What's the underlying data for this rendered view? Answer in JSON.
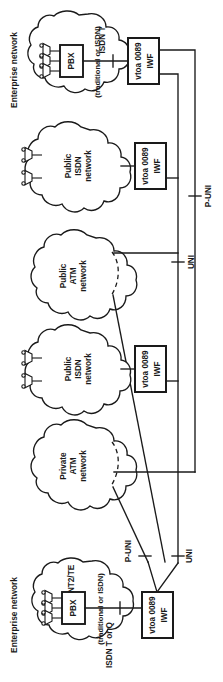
{
  "figure": {
    "orientation": "rotated-90-ccw",
    "colors": {
      "ink": "#1a1a1a",
      "paper": "#ffffff"
    }
  },
  "groups": {
    "enterprise_top": {
      "label": "Enterprise network"
    },
    "enterprise_bottom": {
      "label": "Enterprise network"
    }
  },
  "clouds": [
    {
      "id": "enterprise-top",
      "name": "enterprise-cloud-top",
      "inner_label": "(traditional or ISDN)",
      "device": {
        "label": "PBX",
        "suffix": ""
      },
      "phones": 3,
      "dashed_edge": false
    },
    {
      "id": "public-isdn-upper",
      "name": "public-isdn-cloud-upper",
      "lines": [
        "Public",
        "ISDN",
        "network"
      ],
      "phones": 2,
      "dashed_edge": false
    },
    {
      "id": "public-atm",
      "name": "public-atm-cloud",
      "lines": [
        "Public",
        "ATM",
        "network"
      ],
      "phones": 0,
      "dashed_edge": true
    },
    {
      "id": "public-isdn-lower",
      "name": "public-isdn-cloud-lower",
      "lines": [
        "Public",
        "ISDN",
        "network"
      ],
      "phones": 2,
      "dashed_edge": false
    },
    {
      "id": "private-atm",
      "name": "private-atm-cloud",
      "lines": [
        "Private",
        "ATM",
        "network"
      ],
      "phones": 0,
      "dashed_edge": true
    },
    {
      "id": "enterprise-bottom",
      "name": "enterprise-cloud-bottom",
      "inner_label": "(traditional or ISDN)",
      "device": {
        "label": "PBX",
        "suffix": "NT2/TE"
      },
      "phones": 3,
      "dashed_edge": false
    }
  ],
  "iwf_boxes": [
    {
      "id": "iwf-1",
      "name": "iwf-box-top",
      "line1": "vtoa 0089",
      "line2": "IWF"
    },
    {
      "id": "iwf-2",
      "name": "iwf-box-isdn-upper",
      "line1": "vtoa 0089",
      "line2": "IWF"
    },
    {
      "id": "iwf-3",
      "name": "iwf-box-isdn-lower",
      "line1": "vtoa 0089",
      "line2": "IWF"
    },
    {
      "id": "iwf-4",
      "name": "iwf-box-bottom",
      "line1": "vtoa 0089",
      "line2": "IWF"
    }
  ],
  "interface_labels": [
    {
      "id": "isdn-t-top",
      "name": "interface-label-isdn-t",
      "text": "ISDN T"
    },
    {
      "id": "p-uni-right",
      "name": "interface-label-p-uni-right",
      "text": "P-UNI"
    },
    {
      "id": "uni-right",
      "name": "interface-label-uni-right",
      "text": "UNI"
    },
    {
      "id": "p-uni-bottom",
      "name": "interface-label-p-uni-bottom",
      "text": "P-UNI"
    },
    {
      "id": "uni-bottom",
      "name": "interface-label-uni-bottom",
      "text": "UNI"
    },
    {
      "id": "isdn-t-or-q",
      "name": "interface-label-isdn-t-or-q",
      "text": "ISDN T or Q"
    }
  ]
}
